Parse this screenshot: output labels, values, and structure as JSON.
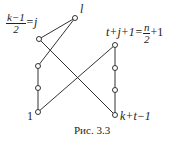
{
  "figure": {
    "caption": "Рис. 3.3",
    "labels": {
      "top_node": "l",
      "j_num": "k−1",
      "j_den": "2",
      "j_rhs": "=j",
      "right_top_lhs": "t+j+1=",
      "right_top_num": "n",
      "right_top_den": "2",
      "right_top_rhs": "+1",
      "bottom_left": "1",
      "bottom_right": "k+t−1"
    }
  }
}
